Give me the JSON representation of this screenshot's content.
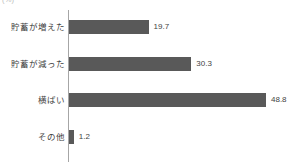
{
  "unit_caption": "(%)",
  "colors": {
    "bar": "#595959",
    "axis": "#a6a6a6",
    "label_text": "#3f3f3f",
    "value_text": "#434343",
    "background": "#ffffff"
  },
  "chart_data": {
    "type": "bar",
    "orientation": "horizontal",
    "title": "",
    "subtitle": "",
    "xlabel": "",
    "ylabel": "",
    "unit": "%",
    "grid": false,
    "legend": false,
    "legend_position": "none",
    "xlim": [
      0,
      48.8
    ],
    "categories": [
      "貯蓄が増えた",
      "貯蓄が減った",
      "横ばい",
      "その他"
    ],
    "values": [
      19.7,
      30.3,
      48.8,
      1.2
    ],
    "value_labels": [
      "19.7",
      "30.3",
      "48.8",
      "1.2"
    ],
    "series": [
      {
        "name": "",
        "values": [
          19.7,
          30.3,
          48.8,
          1.2
        ]
      }
    ]
  },
  "rows": [
    {
      "label": "貯蓄が増えた",
      "value": 19.7,
      "value_label": "19.7",
      "top": 17
    },
    {
      "label": "貯蓄が減った",
      "value": 30.3,
      "value_label": "30.3",
      "top": 54
    },
    {
      "label": "横ばい",
      "value": 48.8,
      "value_label": "48.8",
      "top": 90
    },
    {
      "label": "その他",
      "value": 1.2,
      "value_label": "1.2",
      "top": 127
    }
  ]
}
